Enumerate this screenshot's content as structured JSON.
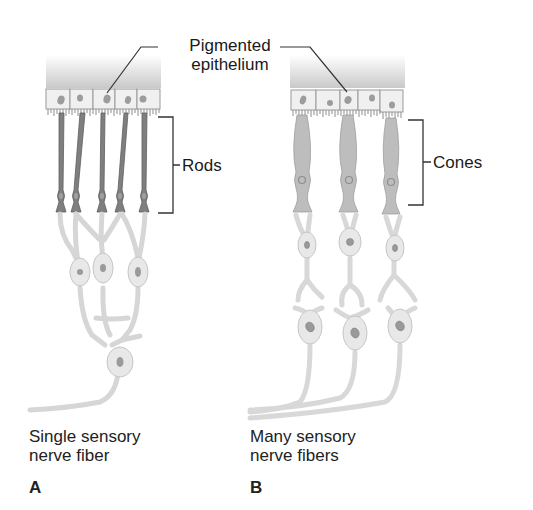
{
  "labels": {
    "pigmented_epithelium_line1": "Pigmented",
    "pigmented_epithelium_line2": "epithelium",
    "rods": "Rods",
    "cones": "Cones"
  },
  "panels": {
    "A": {
      "letter": "A",
      "caption_line1": "Single sensory",
      "caption_line2": "nerve fiber",
      "photoreceptor_type": "rods",
      "photoreceptor_count": 5,
      "bipolar_cells": 3,
      "ganglion_cells": 1
    },
    "B": {
      "letter": "B",
      "caption_line1": "Many sensory",
      "caption_line2": "nerve fibers",
      "photoreceptor_type": "cones",
      "photoreceptor_count": 3,
      "bipolar_cells": 3,
      "ganglion_cells": 3
    }
  },
  "colors": {
    "rod": "#7d7d7d",
    "cone": "#b9b9b9",
    "neuron": "#e6e6e6",
    "neuron_outline": "#c8c8c8",
    "epithelium": "#efefef",
    "nucleus": "#8a8a8a",
    "leader_line": "#333333"
  }
}
